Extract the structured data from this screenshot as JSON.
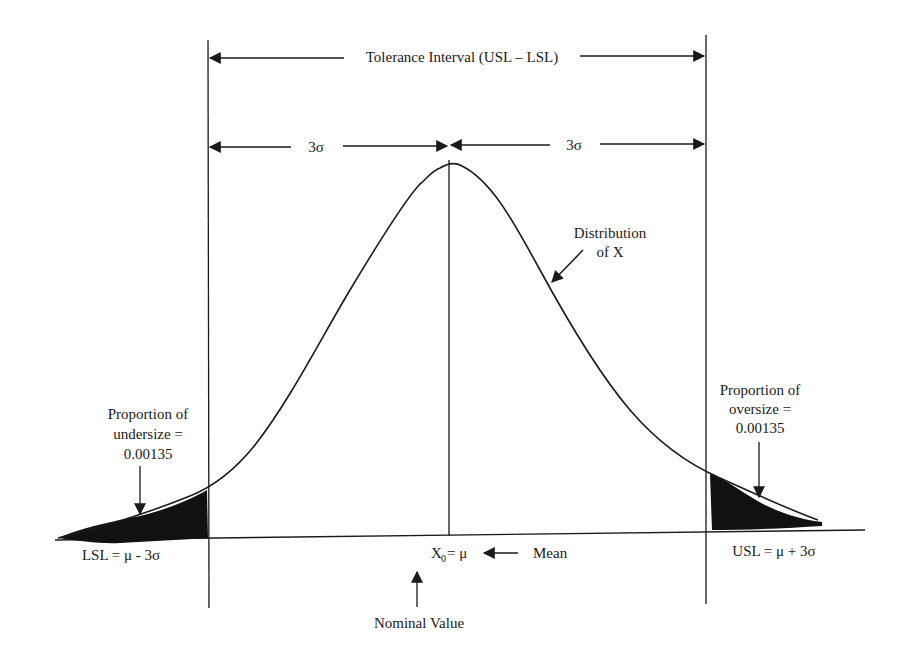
{
  "diagram": {
    "title": "Tolerance Interval (USL – LSL)",
    "left_sigma": "3σ",
    "right_sigma": "3σ",
    "distribution_label": [
      "Distribution",
      "of X"
    ],
    "undersize_label": [
      "Proportion of",
      "undersize =",
      "0.00135"
    ],
    "oversize_label": [
      "Proportion of",
      "oversize =",
      "0.00135"
    ],
    "lsl_label": "LSL = μ - 3σ",
    "usl_label": "USL = μ + 3σ",
    "center_label_main": "X",
    "center_label_sub": "0",
    "center_label_rest": "= μ",
    "mean_label": "Mean",
    "nominal_label": "Nominal Value",
    "colors": {
      "ink": "#1a1a1a",
      "background": "#ffffff"
    }
  }
}
